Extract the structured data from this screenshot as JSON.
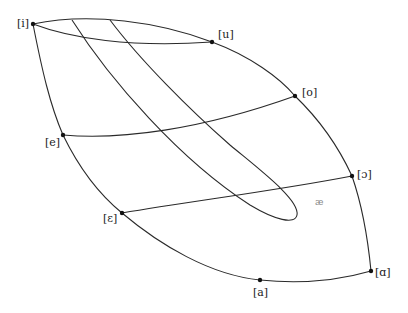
{
  "diagram": {
    "type": "vowel-space-diagram",
    "points": [
      {
        "id": "i",
        "label": "[i]",
        "x": 33,
        "y": 24
      },
      {
        "id": "u",
        "label": "[u]",
        "x": 212,
        "y": 42
      },
      {
        "id": "o",
        "label": "[o]",
        "x": 295,
        "y": 96
      },
      {
        "id": "e",
        "label": "[e]",
        "x": 63,
        "y": 135
      },
      {
        "id": "open_o",
        "label": "[ɔ]",
        "x": 352,
        "y": 176
      },
      {
        "id": "epsilon",
        "label": "[ɛ]",
        "x": 122,
        "y": 213
      },
      {
        "id": "a",
        "label": "[a]",
        "x": 260,
        "y": 280
      },
      {
        "id": "alpha",
        "label": "[ɑ]",
        "x": 371,
        "y": 271
      }
    ],
    "faint_label": "æ",
    "stroke_color": "#2a2a2a",
    "background": "#ffffff"
  }
}
